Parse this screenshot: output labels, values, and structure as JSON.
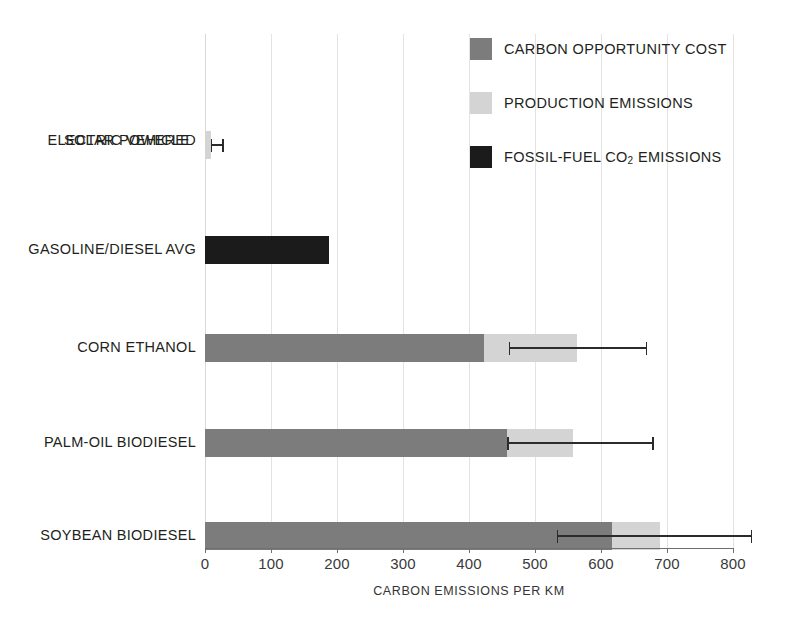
{
  "chart_data": {
    "type": "bar",
    "orientation": "horizontal",
    "stacked": true,
    "title": "",
    "xlabel": "CARBON EMISSIONS PER KM",
    "ylabel": "",
    "xlim": [
      0,
      800
    ],
    "xticks": [
      0,
      100,
      200,
      300,
      400,
      500,
      600,
      700,
      800
    ],
    "xtick_labels": [
      "0",
      "100",
      "200",
      "300",
      "400",
      "500",
      "600",
      "700",
      "800"
    ],
    "grid": true,
    "legend_position": "top-right",
    "categories": [
      "SOLAR POWERED ELECTRIC VEHICLE",
      "GASOLINE/DIESEL AVG",
      "CORN ETHANOL",
      "PALM-OIL BIODIESEL",
      "SOYBEAN BIODIESEL"
    ],
    "series": [
      {
        "name": "CARBON OPPORTUNITY COST",
        "color": "#7c7c7c",
        "values": [
          0,
          0,
          423,
          458,
          617
        ]
      },
      {
        "name": "PRODUCTION EMISSIONS",
        "color": "#d4d4d4",
        "values": [
          9,
          0,
          140,
          100,
          72
        ]
      },
      {
        "name": "FOSSIL-FUEL CO2 EMISSIONS",
        "color": "#1b1b1b",
        "values": [
          0,
          188,
          0,
          0,
          0
        ]
      }
    ],
    "totals": [
      9,
      188,
      563,
      558,
      689
    ],
    "error_bars": [
      {
        "category": "SOLAR POWERED ELECTRIC VEHICLE",
        "low": 9,
        "high": 26
      },
      {
        "category": "GASOLINE/DIESEL AVG",
        "low": null,
        "high": null
      },
      {
        "category": "CORN ETHANOL",
        "low": 460,
        "high": 668
      },
      {
        "category": "PALM-OIL BIODIESEL",
        "low": 458,
        "high": 678
      },
      {
        "category": "SOYBEAN BIODIESEL",
        "low": 533,
        "high": 827
      }
    ]
  },
  "axis": {
    "x_title": "CARBON EMISSIONS PER KM",
    "ticks": [
      "0",
      "100",
      "200",
      "300",
      "400",
      "500",
      "600",
      "700",
      "800"
    ]
  },
  "categories": {
    "solar": {
      "line1": "SOLAR POWERED",
      "line2": "ELECTRIC VEHICLE"
    },
    "gasoline": {
      "line1": "GASOLINE/DIESEL AVG",
      "line2": ""
    },
    "corn": {
      "line1": "CORN ETHANOL",
      "line2": ""
    },
    "palm": {
      "line1": "PALM-OIL BIODIESEL",
      "line2": ""
    },
    "soybean": {
      "line1": "SOYBEAN BIODIESEL",
      "line2": ""
    }
  },
  "legend": {
    "items": [
      {
        "label": "CARBON OPPORTUNITY COST",
        "color": "#7c7c7c"
      },
      {
        "label": "PRODUCTION EMISSIONS",
        "color": "#d4d4d4"
      },
      {
        "label_pre": "FOSSIL-FUEL CO",
        "label_sub": "2",
        "label_post": " EMISSIONS",
        "color": "#1b1b1b"
      }
    ]
  },
  "colors": {
    "carbon_opportunity_cost": "#7c7c7c",
    "production_emissions": "#d4d4d4",
    "fossil_fuel_co2": "#1b1b1b",
    "gridline": "#e3e3e3",
    "axis": "#6f6f6f",
    "text": "#231f20",
    "background": "#ffffff"
  }
}
